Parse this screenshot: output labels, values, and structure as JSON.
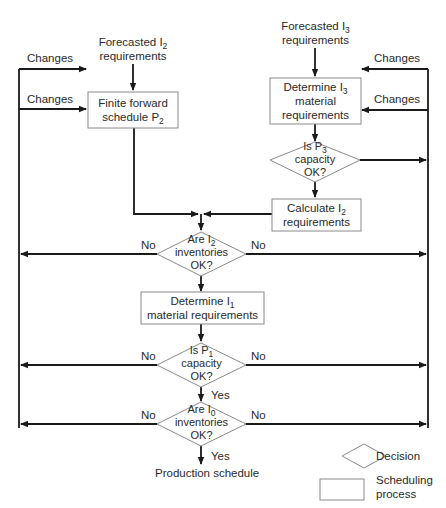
{
  "diagram": {
    "type": "flowchart",
    "inputs": {
      "forecast_i2": {
        "line1": "Forecasted I",
        "sub": "2",
        "line2": "requirements"
      },
      "forecast_i3": {
        "line1": "Forecasted I",
        "sub": "3",
        "line2": "requirements"
      }
    },
    "feedback_labels": {
      "changes_left_top": "Changes",
      "changes_left_mid": "Changes",
      "changes_right_top": "Changes",
      "changes_right_mid": "Changes"
    },
    "processes": {
      "finite_forward": {
        "line1": "Finite forward",
        "line2a": "schedule P",
        "sub": "2"
      },
      "determine_i3": {
        "line1a": "Determine I",
        "sub": "3",
        "line2": "material",
        "line3": "requirements"
      },
      "calculate_i2": {
        "line1a": "Calculate I",
        "sub": "2",
        "line2": "requirements"
      },
      "determine_i1": {
        "line1a": "Determine I",
        "sub": "1",
        "line2": "material requirements"
      }
    },
    "decisions": {
      "p3_capacity": {
        "line1a": "Is P",
        "sub": "3",
        "line2": "capacity",
        "line3": "OK?"
      },
      "i2_inventories": {
        "line1a": "Are I",
        "sub": "2",
        "line2": "inventories",
        "line3": "OK?",
        "no_left": "No",
        "no_right": "No"
      },
      "p1_capacity": {
        "line1a": "Is P",
        "sub": "1",
        "line2": "capacity",
        "line3": "OK?",
        "no_left": "No",
        "no_right": "No",
        "yes": "Yes"
      },
      "i0_inventories": {
        "line1a": "Are I",
        "sub": "0",
        "line2": "inventories",
        "line3": "OK?",
        "no_left": "No",
        "no_right": "No",
        "yes": "Yes"
      }
    },
    "output": "Production schedule",
    "legend": {
      "decision": "Decision",
      "process_line1": "Scheduling",
      "process_line2": "process"
    }
  }
}
